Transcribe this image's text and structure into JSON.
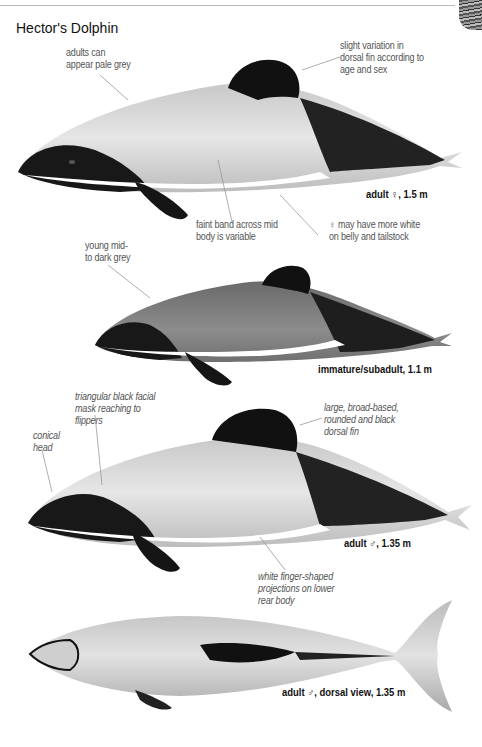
{
  "page": {
    "title": "Hector's Dolphin"
  },
  "figures": [
    {
      "id": "adult-female",
      "caption": "adult ♀, 1.5 m",
      "annotations": [
        {
          "text_line1": "adults can",
          "text_line2": "appear pale grey"
        },
        {
          "text_line1": "slight variation in",
          "text_line2": "dorsal fin according to",
          "text_line3": "age and sex"
        },
        {
          "text_line1": "faint band across mid",
          "text_line2": "body is variable"
        },
        {
          "text_line1": "♀ may have more white",
          "text_line2": "on belly and tailstock"
        }
      ]
    },
    {
      "id": "immature",
      "caption": "immature/subadult, 1.1 m",
      "annotations": [
        {
          "text_line1": "young mid-",
          "text_line2": "to dark grey"
        }
      ]
    },
    {
      "id": "adult-male",
      "caption": "adult ♂, 1.35 m",
      "annotations": [
        {
          "text_line1": "triangular black facial",
          "text_line2": "mask reaching to",
          "text_line3": "flippers"
        },
        {
          "text_line1": "conical",
          "text_line2": "head"
        },
        {
          "text_line1": "large, broad-based,",
          "text_line2": "rounded and black",
          "text_line3": "dorsal fin"
        },
        {
          "text_line1": "white finger-shaped",
          "text_line2": "projections on lower",
          "text_line3": "rear body"
        }
      ]
    },
    {
      "id": "adult-male-dorsal",
      "caption": "adult ♂, dorsal view, 1.35 m"
    }
  ],
  "colors": {
    "body_light": "#d9d9d9",
    "body_mid": "#8a8a8a",
    "black": "#111111",
    "leader": "#999999"
  }
}
